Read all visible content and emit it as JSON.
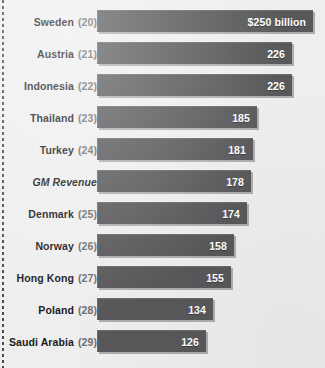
{
  "chart_data": {
    "type": "bar",
    "orientation": "horizontal",
    "title": "",
    "subtitle": "",
    "xlabel": "",
    "ylabel": "",
    "unit_note": "$250 billion",
    "grid": false,
    "legend": null,
    "axis_visible": false,
    "xlim": [
      0,
      250
    ],
    "categories": [
      "Sweden",
      "Austria",
      "Indonesia",
      "Thailand",
      "Turkey",
      "GM Revenue",
      "Denmark",
      "Norway",
      "Hong Kong",
      "Poland",
      "Saudi Arabia"
    ],
    "values": [
      250,
      226,
      226,
      185,
      181,
      178,
      174,
      158,
      155,
      134,
      126
    ],
    "value_labels": [
      "$250 billion",
      "226",
      "226",
      "185",
      "181",
      "178",
      "174",
      "158",
      "155",
      "134",
      "126"
    ],
    "ranks": [
      "(20)",
      "(21)",
      "(22)",
      "(23)",
      "(24)",
      "",
      "(25)",
      "(26)",
      "(27)",
      "(28)",
      "(29)"
    ],
    "colors": {
      "background": "#eeeeef",
      "bar": "#58585a",
      "bar_highlight": "#6a6a6c",
      "bar_shadow": "#78787c",
      "label_text": "#1a1a1a",
      "rank_text": "#6d6d70",
      "value_text": "#ffffff",
      "left_rule": "#4a4a4c"
    }
  },
  "rows": [
    {
      "name": "Sweden",
      "rank": "(20)",
      "value": 250,
      "label": "$250 billion",
      "italic": false
    },
    {
      "name": "Austria",
      "rank": "(21)",
      "value": 226,
      "label": "226",
      "italic": false
    },
    {
      "name": "Indonesia",
      "rank": "(22)",
      "value": 226,
      "label": "226",
      "italic": false
    },
    {
      "name": "Thailand",
      "rank": "(23)",
      "value": 185,
      "label": "185",
      "italic": false
    },
    {
      "name": "Turkey",
      "rank": "(24)",
      "value": 181,
      "label": "181",
      "italic": false
    },
    {
      "name": "GM Revenue",
      "rank": "",
      "value": 178,
      "label": "178",
      "italic": true
    },
    {
      "name": "Denmark",
      "rank": "(25)",
      "value": 174,
      "label": "174",
      "italic": false
    },
    {
      "name": "Norway",
      "rank": "(26)",
      "value": 158,
      "label": "158",
      "italic": false
    },
    {
      "name": "Hong Kong",
      "rank": "(27)",
      "value": 155,
      "label": "155",
      "italic": false
    },
    {
      "name": "Poland",
      "rank": "(28)",
      "value": 134,
      "label": "134",
      "italic": false
    },
    {
      "name": "Saudi Arabia",
      "rank": "(29)",
      "value": 126,
      "label": "126",
      "italic": false
    }
  ],
  "layout": {
    "bar_origin_x": 97,
    "bar_max_width": 216,
    "row_pitch": 32,
    "first_row_top": 10,
    "bar_height": 22
  }
}
